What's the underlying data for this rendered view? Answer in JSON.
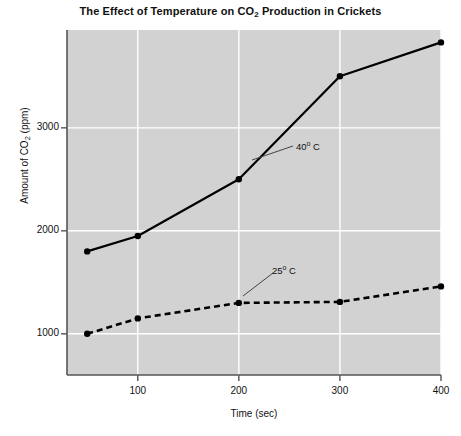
{
  "chart_data": {
    "type": "line",
    "title": "The Effect of Temperature on CO2 Production in Crickets",
    "title_parts": {
      "before": "The Effect of Temperature on CO",
      "subscript": "2",
      "after": " Production in Crickets"
    },
    "xlabel": "Time (sec)",
    "ylabel": "Amount of CO2 (ppm)",
    "ylabel_parts": {
      "before": "Amount of CO",
      "subscript": "2",
      "after": " (ppm)"
    },
    "x": [
      50,
      100,
      200,
      300,
      400
    ],
    "xlim": [
      30,
      400
    ],
    "ylim": [
      600,
      3950
    ],
    "xticks": [
      100,
      200,
      300,
      400
    ],
    "xtick_labels": [
      "100",
      "200",
      "300",
      "400"
    ],
    "yticks": [
      1000,
      2000,
      3000
    ],
    "ytick_labels": [
      "1000",
      "2000",
      "3000"
    ],
    "grid": true,
    "legend_position": "inline-annotations",
    "plot_background": "#d2d2d2",
    "grid_color": "#ffffff",
    "line_color": "#000000",
    "series": [
      {
        "name": "40 C",
        "label": "40° C",
        "label_number": "40",
        "label_degree": "o",
        "label_unit": " C",
        "style": "solid",
        "marker": "circle",
        "values": [
          1800,
          1950,
          2500,
          3500,
          3830
        ]
      },
      {
        "name": "25 C",
        "label": "25° C",
        "label_number": "25",
        "label_degree": "o",
        "label_unit": " C",
        "style": "dashed",
        "marker": "circle",
        "values": [
          1000,
          1150,
          1300,
          1310,
          1460
        ]
      }
    ],
    "annotations": [
      {
        "text": "40° C",
        "target_series": "40 C",
        "leader_line": true
      },
      {
        "text": "25° C",
        "target_series": "25 C",
        "leader_line": true
      }
    ]
  }
}
